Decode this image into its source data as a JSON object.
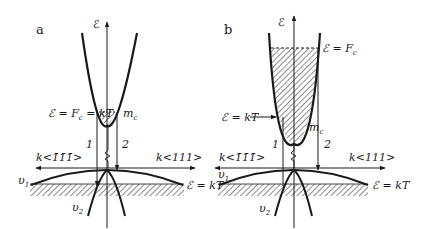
{
  "panels": [
    {
      "id": "a",
      "label": "a",
      "energy_axis_label": "ℰ",
      "fermi_label": "ℰ = F",
      "fermi_sub": "c",
      "fermi_suffix": " = kT",
      "mass_label": "m",
      "mass_sub": "c",
      "transition_1": "1",
      "transition_2": "2",
      "k_left_label": "k<1̄1̄1̄>",
      "k_right_label": "k<111>",
      "band_v1_label": "υ",
      "band_v1_sub": "1",
      "band_v2_label": "υ",
      "band_v2_sub": "2",
      "thermal_label": "ℰ = kT"
    },
    {
      "id": "b",
      "label": "b",
      "energy_axis_label": "ℰ",
      "fermi_label": "ℰ = F",
      "fermi_sub": "c",
      "kt_label": "ℰ = kT",
      "mass_label": "m",
      "mass_sub": "c",
      "transition_1": "1",
      "transition_2": "2",
      "k_left_label": "k<1̄1̄1̄>",
      "k_right_label": "k<111>",
      "band_v1_label": "υ",
      "band_v1_sub": "1",
      "band_v2_label": "υ",
      "band_v2_sub": "2",
      "thermal_label": "ℰ = kT"
    }
  ],
  "colors": {
    "ink": "#1a1a1a",
    "background": "#ffffff"
  }
}
